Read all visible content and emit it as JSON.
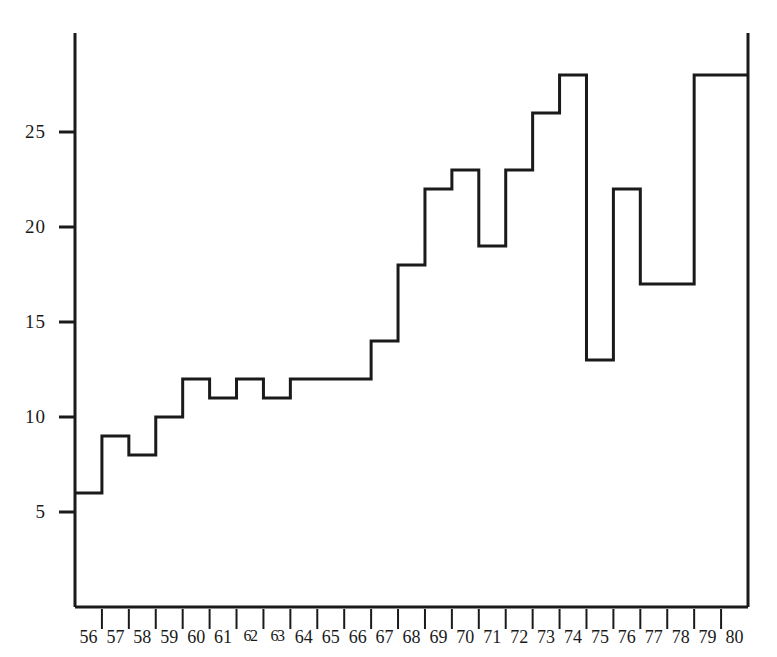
{
  "chart_data": {
    "type": "bar",
    "render_style": "step-outline-histogram",
    "title": "",
    "subtitle": "",
    "xlabel": "",
    "ylabel": "",
    "categories": [
      "56",
      "57",
      "58",
      "59",
      "60",
      "61",
      "62",
      "63",
      "64",
      "65",
      "66",
      "67",
      "68",
      "69",
      "70",
      "71",
      "72",
      "73",
      "74",
      "75",
      "76",
      "77",
      "78",
      "79",
      "80"
    ],
    "values": [
      6,
      9,
      8,
      10,
      12,
      11,
      12,
      11,
      12,
      12,
      12,
      14,
      18,
      22,
      23,
      19,
      23,
      26,
      28,
      13,
      22,
      17,
      17,
      28,
      28
    ],
    "ylim": [
      0,
      30
    ],
    "xlim_categories": [
      "56",
      "80"
    ],
    "y_ticks": [
      5,
      10,
      15,
      20,
      25
    ],
    "y_tick_labels": [
      "5",
      "10",
      "15",
      "20",
      "25"
    ],
    "grid": false,
    "legend": null,
    "legend_position": "none",
    "annotations": []
  },
  "axes": {
    "y_axis_name": "y-axis",
    "x_axis_name": "x-axis",
    "tick_marks": "outward short ticks on y-axis; vertical separators between x categories"
  },
  "style": {
    "line_color": "#1a1a1a",
    "background_color": "#ffffff",
    "axis_color": "#1a1a1a",
    "line_width": "3"
  },
  "x_tick_display": [
    {
      "label": "56",
      "squeezed": false
    },
    {
      "label": "57",
      "squeezed": false
    },
    {
      "label": "58",
      "squeezed": false
    },
    {
      "label": "59",
      "squeezed": false
    },
    {
      "label": "60",
      "squeezed": false
    },
    {
      "label": "61",
      "squeezed": false
    },
    {
      "label": "62",
      "squeezed": true
    },
    {
      "label": "63",
      "squeezed": true
    },
    {
      "label": "64",
      "squeezed": false
    },
    {
      "label": "65",
      "squeezed": false
    },
    {
      "label": "66",
      "squeezed": false
    },
    {
      "label": "67",
      "squeezed": false
    },
    {
      "label": "68",
      "squeezed": false
    },
    {
      "label": "69",
      "squeezed": false
    },
    {
      "label": "70",
      "squeezed": false
    },
    {
      "label": "71",
      "squeezed": false
    },
    {
      "label": "72",
      "squeezed": false
    },
    {
      "label": "73",
      "squeezed": false
    },
    {
      "label": "74",
      "squeezed": false
    },
    {
      "label": "75",
      "squeezed": false
    },
    {
      "label": "76",
      "squeezed": false
    },
    {
      "label": "77",
      "squeezed": false
    },
    {
      "label": "78",
      "squeezed": false
    },
    {
      "label": "79",
      "squeezed": false
    },
    {
      "label": "80",
      "squeezed": false
    }
  ]
}
